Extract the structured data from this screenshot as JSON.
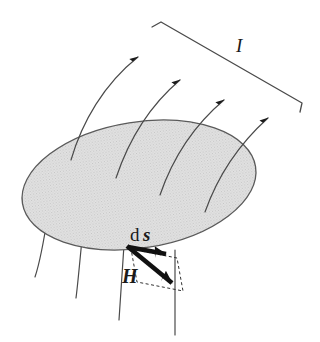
{
  "figure": {
    "kind": "physics-diagram",
    "background_color": "#ffffff",
    "canvas": {
      "width": 320,
      "height": 342
    },
    "labels": [
      {
        "id": "current",
        "text": "I",
        "style": "italic-serif",
        "x": 243,
        "y": 48,
        "color": "#1a1a1a"
      },
      {
        "id": "ds-d",
        "text": "d",
        "style": "roman-serif",
        "x": 131,
        "y": 240,
        "color": "#1a1a1a"
      },
      {
        "id": "ds-s",
        "text": "s",
        "style": "bold-italic-serif",
        "x": 144,
        "y": 240,
        "color": "#1a1a1a"
      },
      {
        "id": "field",
        "text": "H",
        "style": "bold-italic-serif",
        "x": 124,
        "y": 281,
        "color": "#1a1a1a"
      }
    ],
    "surface": {
      "name": "elliptical-surface",
      "center_x": 139,
      "center_y": 185,
      "radius_x": 118,
      "radius_y": 63,
      "rotation_deg": -9,
      "fill_color": "#d9d9d9",
      "stroke_color": "#555555",
      "stroke_width": 1.2,
      "pattern": "halftone-dither"
    },
    "bracket": {
      "name": "current-loop-bracket",
      "stroke_color": "#4a4a4a",
      "stroke_width": 1.2,
      "start_x": 160,
      "start_y": 22,
      "end_x": 302,
      "end_y": 104,
      "tick_length": 9
    },
    "field_lines": {
      "stroke_color": "#4a4a4a",
      "stroke_width": 1.2,
      "arrow_color": "#1a1a1a",
      "count_with_arrows": 4,
      "count_below_surface": 4
    },
    "vectors": [
      {
        "id": "ds-vector",
        "label": "ds",
        "from_x": 129,
        "from_y": 248,
        "to_x": 176,
        "to_y": 257,
        "color": "#111111",
        "weight": "bold"
      },
      {
        "id": "H-vector",
        "label": "H",
        "from_x": 127,
        "from_y": 247,
        "to_x": 182,
        "to_y": 292,
        "color": "#111111",
        "weight": "bold"
      }
    ],
    "dashed_outline": {
      "name": "projection-parallelogram",
      "stroke_color": "#333333",
      "stroke_width": 1,
      "dash_pattern": "3 2.5"
    }
  }
}
